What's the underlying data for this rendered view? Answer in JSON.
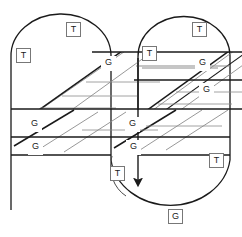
{
  "diagram": {
    "type": "line-diagram",
    "title": "",
    "canvas": {
      "width": 242,
      "height": 237
    },
    "colors": {
      "stroke_dark": "#1a1a1a",
      "stroke_mid": "#4a4a4a",
      "stroke_light": "#8c8c8c",
      "background": "#ffffff",
      "label_border": "#777777",
      "label_text": "#1a1a1a"
    },
    "labels": [
      {
        "id": "label-t-1",
        "text": "T",
        "kind": "T",
        "x": 66,
        "y": 22
      },
      {
        "id": "label-t-2",
        "text": "T",
        "kind": "T",
        "x": 16,
        "y": 48
      },
      {
        "id": "label-t-3",
        "text": "T",
        "kind": "T",
        "x": 192,
        "y": 22
      },
      {
        "id": "label-t-4",
        "text": "T",
        "kind": "T",
        "x": 142,
        "y": 46
      },
      {
        "id": "label-g-1",
        "text": "G",
        "kind": "G",
        "x": 101,
        "y": 56
      },
      {
        "id": "label-g-2",
        "text": "G",
        "kind": "G",
        "x": 195,
        "y": 56
      },
      {
        "id": "label-g-3",
        "text": "G",
        "kind": "G",
        "x": 199,
        "y": 83
      },
      {
        "id": "label-g-4",
        "text": "G",
        "kind": "G",
        "x": 27,
        "y": 117
      },
      {
        "id": "label-g-5",
        "text": "G",
        "kind": "G",
        "x": 125,
        "y": 117
      },
      {
        "id": "label-g-6",
        "text": "G",
        "kind": "G",
        "x": 28,
        "y": 140
      },
      {
        "id": "label-g-7",
        "text": "G",
        "kind": "G",
        "x": 126,
        "y": 140
      },
      {
        "id": "label-t-5",
        "text": "T",
        "kind": "T",
        "x": 209,
        "y": 153
      },
      {
        "id": "label-t-6",
        "text": "T",
        "kind": "T",
        "x": 110,
        "y": 166
      },
      {
        "id": "label-g-8",
        "text": "G",
        "kind": "G",
        "x": 168,
        "y": 209
      }
    ],
    "paths": {
      "left_dome": "M 11 208 L 11 56 A 50 40 0 0 1 111 56 L 111 155",
      "right_dome": "M 138 56 A 46 38 0 0 1 230 56 L 230 155",
      "bottom_loop": "M 111 155 A 62 52 0 0 0 230 155",
      "band_top_y": 52,
      "band_mid_upper_y": 80,
      "band_mid_lower_y": 109,
      "band_bottom_y": 137,
      "band_close_y": 155,
      "arrow_x": 138,
      "arrow_from_y": 56,
      "arrow_to_y": 188
    }
  }
}
